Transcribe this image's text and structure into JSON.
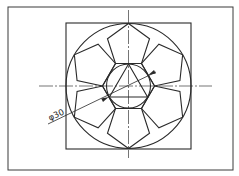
{
  "drawing": {
    "type": "geometric construction",
    "description": "Hexagon inscribed in a circle with six regular pentagons on its edges, all inscribed within a larger circle inside a square",
    "dimension_label": "φ30",
    "elements": {
      "outer_frame": {
        "x": 8,
        "y": 7,
        "width": 225,
        "height": 163
      },
      "square": {
        "x": 66,
        "y": 23,
        "width": 125,
        "height": 126
      },
      "outer_circle": {
        "cx": 128.5,
        "cy": 86,
        "r": 62.5
      },
      "inner_circle": {
        "cx": 128.5,
        "cy": 86,
        "r": 22,
        "diameter_label": "φ30"
      },
      "hexagon": {
        "cx": 128.5,
        "cy": 86,
        "circumradius": 26,
        "orientation": "flat-top"
      },
      "pentagons": {
        "count": 6,
        "side": 26
      },
      "triangle": {
        "orientation": "apex-up",
        "inscribed_in": "inner_circle"
      },
      "centerlines": {
        "horizontal": {
          "x1": 39,
          "x2": 212,
          "y": 86
        },
        "vertical": {
          "x": 128.5,
          "y1": 10,
          "y2": 158
        }
      }
    }
  }
}
